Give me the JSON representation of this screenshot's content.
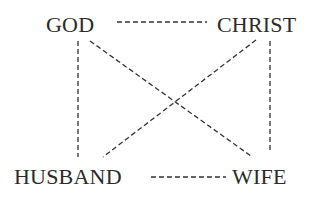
{
  "diagram": {
    "nodes": {
      "god": "GOD",
      "christ": "CHRIST",
      "husband": "HUSBAND",
      "wife": "WIFE"
    },
    "edges": [
      {
        "from": "GOD",
        "to": "CHRIST",
        "style": "dashed"
      },
      {
        "from": "HUSBAND",
        "to": "WIFE",
        "style": "dashed"
      },
      {
        "from": "GOD",
        "to": "HUSBAND",
        "style": "dashed"
      },
      {
        "from": "CHRIST",
        "to": "WIFE",
        "style": "dashed"
      },
      {
        "from": "GOD",
        "to": "WIFE",
        "style": "dashed"
      },
      {
        "from": "CHRIST",
        "to": "HUSBAND",
        "style": "dashed"
      }
    ],
    "colors": {
      "line": "#333333",
      "text": "#2b2b2b",
      "background": "#ffffff"
    }
  }
}
